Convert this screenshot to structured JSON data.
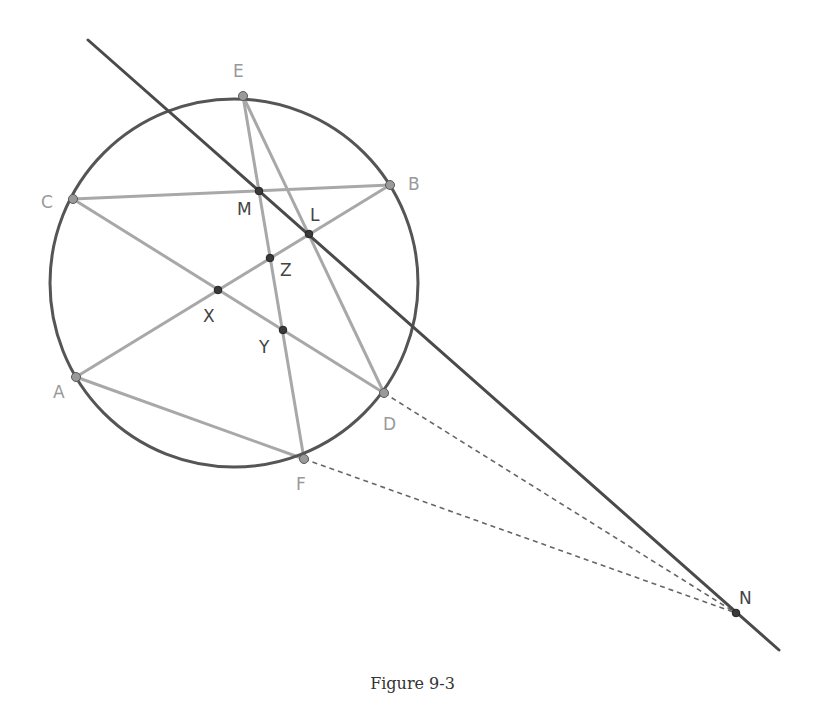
{
  "caption": "Figure 9-3",
  "colors": {
    "circle": "#555555",
    "main_line": "#4a4a4a",
    "chords": "#a8a8a8",
    "dashed": "#666666",
    "vertex_point_fill": "#9a9a9a",
    "intersection_point_fill": "#3a3a3a",
    "label_light": "#999999",
    "label_dark": "#444444"
  },
  "circle": {
    "cx": 234,
    "cy": 283,
    "r": 184
  },
  "points": {
    "A": {
      "label": "A",
      "x": 76,
      "y": 377,
      "kind": "vertex"
    },
    "B": {
      "label": "B",
      "x": 390,
      "y": 185,
      "kind": "vertex"
    },
    "C": {
      "label": "C",
      "x": 73,
      "y": 199,
      "kind": "vertex"
    },
    "D": {
      "label": "D",
      "x": 384,
      "y": 393,
      "kind": "vertex"
    },
    "E": {
      "label": "E",
      "x": 243,
      "y": 96,
      "kind": "vertex"
    },
    "F": {
      "label": "F",
      "x": 304,
      "y": 459,
      "kind": "vertex"
    },
    "M": {
      "label": "M",
      "x": 259,
      "y": 191,
      "kind": "intersection"
    },
    "L": {
      "label": "L",
      "x": 309,
      "y": 234,
      "kind": "intersection"
    },
    "Z": {
      "label": "Z",
      "x": 270,
      "y": 258,
      "kind": "intersection"
    },
    "X": {
      "label": "X",
      "x": 218,
      "y": 290,
      "kind": "intersection"
    },
    "Y": {
      "label": "Y",
      "x": 283,
      "y": 330,
      "kind": "intersection"
    },
    "N": {
      "label": "N",
      "x": 736,
      "y": 613,
      "kind": "intersection"
    }
  },
  "chords": [
    [
      "C",
      "B"
    ],
    [
      "C",
      "D"
    ],
    [
      "A",
      "B"
    ],
    [
      "A",
      "F"
    ],
    [
      "E",
      "F"
    ],
    [
      "E",
      "D"
    ]
  ],
  "main_line": {
    "from": [
      88,
      40
    ],
    "to": [
      779,
      650
    ],
    "through": [
      "M",
      "L",
      "N"
    ]
  },
  "dashed_segments": [
    [
      "D",
      "N"
    ],
    [
      "F",
      "N"
    ]
  ],
  "labels": [
    {
      "text": "E",
      "x": 233,
      "y": 77,
      "tone": "light"
    },
    {
      "text": "B",
      "x": 408,
      "y": 190,
      "tone": "light"
    },
    {
      "text": "C",
      "x": 41,
      "y": 208,
      "tone": "light"
    },
    {
      "text": "M",
      "x": 237,
      "y": 215,
      "tone": "dark"
    },
    {
      "text": "L",
      "x": 310,
      "y": 221,
      "tone": "dark"
    },
    {
      "text": "Z",
      "x": 280,
      "y": 276,
      "tone": "dark"
    },
    {
      "text": "X",
      "x": 203,
      "y": 322,
      "tone": "dark"
    },
    {
      "text": "Y",
      "x": 259,
      "y": 353,
      "tone": "dark"
    },
    {
      "text": "A",
      "x": 53,
      "y": 398,
      "tone": "light"
    },
    {
      "text": "D",
      "x": 383,
      "y": 430,
      "tone": "light"
    },
    {
      "text": "F",
      "x": 296,
      "y": 490,
      "tone": "light"
    },
    {
      "text": "N",
      "x": 739,
      "y": 604,
      "tone": "dark"
    }
  ]
}
